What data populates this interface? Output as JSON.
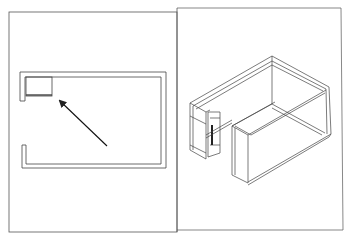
{
  "diagram": {
    "type": "technical-drawing",
    "panels": [
      {
        "id": "plan-view",
        "description": "2D floor plan with arrow pointing to small box in top-left corner"
      },
      {
        "id": "isometric-view",
        "description": "3D isometric wireframe of the same room"
      }
    ],
    "colors": {
      "line": "#333333",
      "frame": "#555555",
      "background": "#ffffff"
    }
  }
}
